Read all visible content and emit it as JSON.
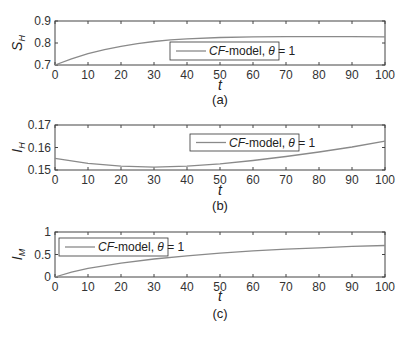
{
  "chart_data": [
    {
      "type": "line",
      "panel": "(a)",
      "xlabel": "t",
      "ylabel": "S_H",
      "xlim": [
        0,
        100
      ],
      "ylim": [
        0.7,
        0.9
      ],
      "xticks": [
        "0",
        "10",
        "20",
        "30",
        "40",
        "50",
        "60",
        "70",
        "80",
        "90",
        "100"
      ],
      "yticks": [
        "0.7",
        "0.8",
        "0.9"
      ],
      "legend": {
        "label_prefix": "CF",
        "label_mid": "-model, ",
        "label_theta": "θ",
        "label_suffix": " = 1",
        "position": "center"
      },
      "series": [
        {
          "name": "CF-model, θ=1",
          "x": [
            0,
            5,
            10,
            15,
            20,
            25,
            30,
            35,
            40,
            50,
            60,
            70,
            80,
            90,
            100
          ],
          "values": [
            0.7,
            0.728,
            0.752,
            0.77,
            0.785,
            0.797,
            0.807,
            0.814,
            0.819,
            0.825,
            0.828,
            0.829,
            0.829,
            0.829,
            0.828
          ]
        }
      ]
    },
    {
      "type": "line",
      "panel": "(b)",
      "xlabel": "t",
      "ylabel": "I_H",
      "xlim": [
        0,
        100
      ],
      "ylim": [
        0.15,
        0.17
      ],
      "xticks": [
        "0",
        "10",
        "20",
        "30",
        "40",
        "50",
        "60",
        "70",
        "80",
        "90",
        "100"
      ],
      "yticks": [
        "0.15",
        "0.16",
        "0.17"
      ],
      "legend": {
        "label_prefix": "CF",
        "label_mid": "-model, ",
        "label_theta": "θ",
        "label_suffix": " = 1",
        "position": "center-right"
      },
      "series": [
        {
          "name": "CF-model, θ=1",
          "x": [
            0,
            10,
            20,
            30,
            40,
            50,
            60,
            70,
            80,
            90,
            100
          ],
          "values": [
            0.1552,
            0.153,
            0.1517,
            0.1513,
            0.1517,
            0.1527,
            0.1542,
            0.156,
            0.158,
            0.1602,
            0.1628
          ]
        }
      ]
    },
    {
      "type": "line",
      "panel": "(c)",
      "xlabel": "t",
      "ylabel": "I_M",
      "xlim": [
        0,
        100
      ],
      "ylim": [
        0,
        1
      ],
      "xticks": [
        "0",
        "10",
        "20",
        "30",
        "40",
        "50",
        "60",
        "70",
        "80",
        "90",
        "100"
      ],
      "yticks": [
        "0",
        "0.5",
        "1"
      ],
      "legend": {
        "label_prefix": "CF",
        "label_mid": "-model, ",
        "label_theta": "θ",
        "label_suffix": " = 1",
        "position": "northwest"
      },
      "series": [
        {
          "name": "CF-model, θ=1",
          "x": [
            0,
            5,
            10,
            20,
            30,
            40,
            50,
            60,
            70,
            80,
            90,
            100
          ],
          "values": [
            0.0,
            0.11,
            0.19,
            0.31,
            0.4,
            0.47,
            0.53,
            0.58,
            0.62,
            0.65,
            0.68,
            0.7
          ]
        }
      ]
    }
  ],
  "colors": {
    "line": "#8a8a8a",
    "axes": "#444444",
    "legend_border": "#333333"
  },
  "labels": {
    "panel_a": "(a)",
    "panel_b": "(b)",
    "panel_c": "(c)",
    "t": "t",
    "ylabel_a_main": "S",
    "ylabel_a_sub": "H",
    "ylabel_b_main": "I",
    "ylabel_b_sub": "H",
    "ylabel_c_main": "I",
    "ylabel_c_sub": "M"
  }
}
